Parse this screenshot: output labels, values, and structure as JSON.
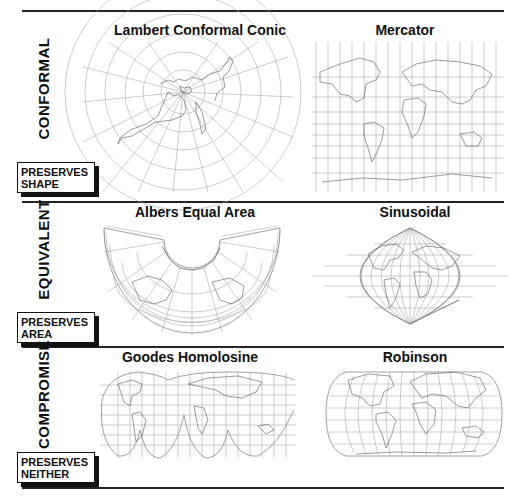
{
  "rules_y": [
    11,
    202,
    347,
    488
  ],
  "sections": [
    {
      "category": "CONFORMAL",
      "badge": {
        "line1": "PRESERVES",
        "line2": "SHAPE"
      },
      "projections": [
        {
          "name": "Lambert Conformal Conic"
        },
        {
          "name": "Mercator"
        }
      ]
    },
    {
      "category": "EQUIVALENT",
      "badge": {
        "line1": "PRESERVES",
        "line2": "AREA"
      },
      "projections": [
        {
          "name": "Albers Equal Area"
        },
        {
          "name": "Sinusoidal"
        }
      ]
    },
    {
      "category": "COMPROMISE",
      "badge": {
        "line1": "PRESERVES",
        "line2": "NEITHER"
      },
      "projections": [
        {
          "name": "Goodes Homolosine"
        },
        {
          "name": "Robinson"
        }
      ]
    }
  ],
  "colors": {
    "ink": "#111111",
    "graticule": "#aaaaaa",
    "coastline": "#555555"
  }
}
